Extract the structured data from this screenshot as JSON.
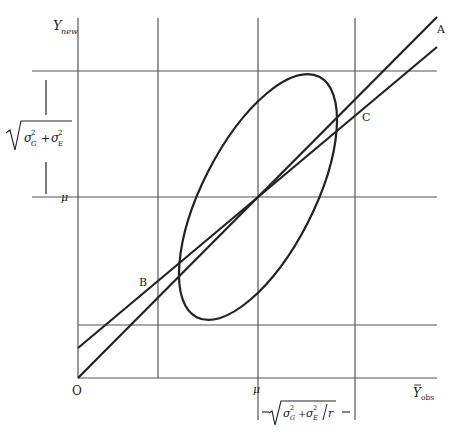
{
  "diagram": {
    "colors": {
      "ink": "#222222",
      "grid": "#555555",
      "background": "#ffffff"
    },
    "axes": {
      "y_label_main": "Y",
      "y_label_sub": "new",
      "x_label_main": "Y",
      "x_label_sub": "obs",
      "x_label_bar": "—",
      "origin_label": "O"
    },
    "points": {
      "A": "A",
      "B": "B",
      "C": "C"
    },
    "mu": {
      "y_axis_label": "μ",
      "x_axis_label": "μ"
    },
    "annotations": {
      "vertical_extent": {
        "sigma_G": "σ",
        "sigma_G_sup": "2",
        "sigma_G_sub": "G",
        "plus": "+",
        "sigma_E": "σ",
        "sigma_E_sup": "2",
        "sigma_E_sub": "E",
        "text": "√(σ²_G + σ²_E)"
      },
      "horizontal_extent": {
        "sigma_G": "σ",
        "sigma_G_sup": "2",
        "sigma_G_sub": "G",
        "plus": "+",
        "sigma_E": "σ",
        "sigma_E_sup": "2",
        "sigma_E_sub": "E",
        "divisor": "r",
        "text": "√(σ²_G + σ²_E / r)"
      }
    }
  }
}
